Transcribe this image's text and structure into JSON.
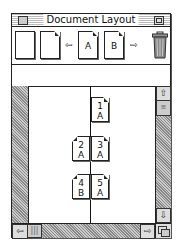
{
  "window": {
    "title": "Document Layout"
  },
  "toolbar": {
    "items": [
      {
        "name": "blank-page",
        "label": ""
      },
      {
        "name": "dogear-page",
        "label": ""
      },
      {
        "name": "arrow-left",
        "glyph": "⇦"
      },
      {
        "name": "master-page-a",
        "label": "A"
      },
      {
        "name": "master-page-b",
        "label": "B"
      },
      {
        "name": "arrow-right",
        "glyph": "⇨"
      },
      {
        "name": "trash",
        "label": ""
      }
    ]
  },
  "layout": {
    "pages": [
      {
        "number": "1",
        "master": "A",
        "side": "right"
      },
      {
        "number": "2",
        "master": "A",
        "side": "left"
      },
      {
        "number": "3",
        "master": "A",
        "side": "right"
      },
      {
        "number": "4",
        "master": "B",
        "side": "left"
      },
      {
        "number": "5",
        "master": "A",
        "side": "right"
      }
    ]
  },
  "scrollbars": {
    "up": "⇧",
    "down": "⇩",
    "left": "⇦",
    "right": "⇨"
  }
}
